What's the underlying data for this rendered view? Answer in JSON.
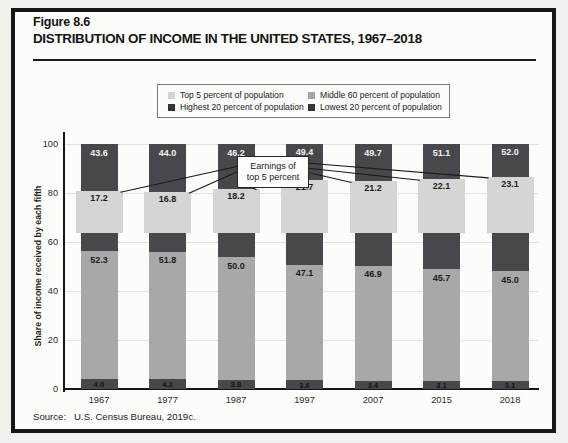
{
  "figure": {
    "label": "Figure 8.6",
    "title": "DISTRIBUTION OF INCOME IN THE UNITED STATES, 1967–2018"
  },
  "source": {
    "label": "Source:",
    "text": "U.S. Census Bureau, 2019c."
  },
  "legend": {
    "items": [
      {
        "name": "top5",
        "label": "Top 5 percent of population",
        "color": "#d3d3d3"
      },
      {
        "name": "middle60",
        "label": "Middle 60 percent of population",
        "color": "#a6a6a6"
      },
      {
        "name": "highest20",
        "label": "Highest 20 percent of population",
        "color": "#353539"
      },
      {
        "name": "lowest20",
        "label": "Lowest 20 percent of population",
        "color": "#353539"
      }
    ]
  },
  "callout": {
    "line1": "Earnings of",
    "line2": "top 5 percent"
  },
  "colors": {
    "dark": "#48484c",
    "medium": "#a8a8a8",
    "light": "#d5d5d4",
    "grid": "#e3e2de",
    "axis": "#161616",
    "card_bg": "#fcfcfa",
    "page_bg": "#f3f1ed"
  },
  "chart_data": {
    "type": "bar",
    "stacked": true,
    "title": "DISTRIBUTION OF INCOME IN THE UNITED STATES, 1967–2018",
    "xlabel": "",
    "ylabel": "Share of income received by each fifth",
    "ylim": [
      0,
      100
    ],
    "yticks": [
      0,
      20,
      40,
      60,
      80,
      100
    ],
    "grid": "horizontal",
    "legend_position": "top",
    "categories": [
      "1967",
      "1977",
      "1987",
      "1997",
      "2007",
      "2015",
      "2018"
    ],
    "series": [
      {
        "name": "Lowest 20 percent of population",
        "role": "stack-bottom",
        "values": [
          4.0,
          4.2,
          3.8,
          3.6,
          3.4,
          3.1,
          3.1
        ]
      },
      {
        "name": "Middle 60 percent of population",
        "role": "stack-middle",
        "values": [
          52.3,
          51.8,
          50.0,
          47.1,
          46.9,
          45.7,
          45.0
        ]
      },
      {
        "name": "Highest 20 percent of population",
        "role": "stack-top",
        "values": [
          43.6,
          44.0,
          46.2,
          49.4,
          49.7,
          51.1,
          52.0
        ]
      },
      {
        "name": "Top 5 percent of population",
        "role": "overlay-band",
        "values": [
          17.2,
          16.8,
          18.2,
          21.7,
          21.2,
          22.1,
          23.1
        ]
      }
    ],
    "annotation": "Earnings of top 5 percent"
  }
}
